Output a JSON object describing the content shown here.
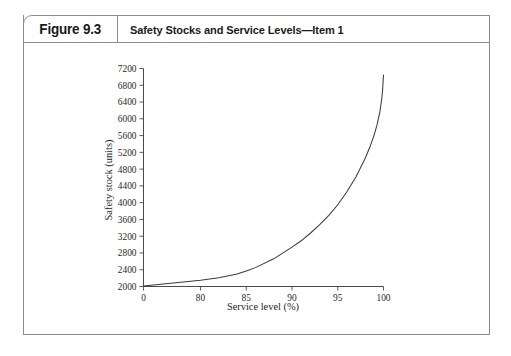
{
  "figure": {
    "number_label": "Figure 9.3",
    "title": "Safety Stocks and Service Levels—Item 1"
  },
  "chart_data": {
    "type": "line",
    "title": "Safety Stocks and Service Levels—Item 1",
    "xlabel": "Service level (%)",
    "ylabel": "Safety stock (units)",
    "xlim": [
      0,
      100
    ],
    "ylim": [
      2000,
      7200
    ],
    "grid": false,
    "legend": null,
    "x_tick_labels": [
      "0",
      "80",
      "85",
      "90",
      "95",
      "100"
    ],
    "x_tick_values": [
      0,
      80,
      85,
      90,
      95,
      100
    ],
    "y_tick_labels": [
      "2000",
      "2400",
      "2800",
      "3200",
      "3600",
      "4000",
      "4400",
      "4800",
      "5200",
      "5600",
      "6000",
      "6400",
      "6800",
      "7200"
    ],
    "y_tick_values": [
      2000,
      2400,
      2800,
      3200,
      3600,
      4000,
      4400,
      4800,
      5200,
      5600,
      6000,
      6400,
      6800,
      7200
    ],
    "axis_note": "x-axis has a scale break between 0 and 80; ticks 80-100 are evenly spaced at 5% intervals",
    "series": [
      {
        "name": "Safety stock",
        "x": [
          0,
          80,
          82,
          84,
          85,
          86,
          88,
          90,
          91,
          92,
          93,
          94,
          95,
          96,
          97,
          98,
          98.5,
          99,
          99.3,
          99.6,
          99.8,
          99.9,
          100
        ],
        "values": [
          2010,
          2150,
          2210,
          2300,
          2370,
          2450,
          2660,
          2940,
          3090,
          3270,
          3470,
          3690,
          3950,
          4260,
          4620,
          5060,
          5320,
          5630,
          5860,
          6160,
          6460,
          6680,
          7050
        ]
      }
    ]
  },
  "colors": {
    "frame_border": "#8c8c8c",
    "axis": "#4a4a4a",
    "curve": "#3a3a3a",
    "text": "#1f1f1f",
    "background": "#ffffff"
  }
}
